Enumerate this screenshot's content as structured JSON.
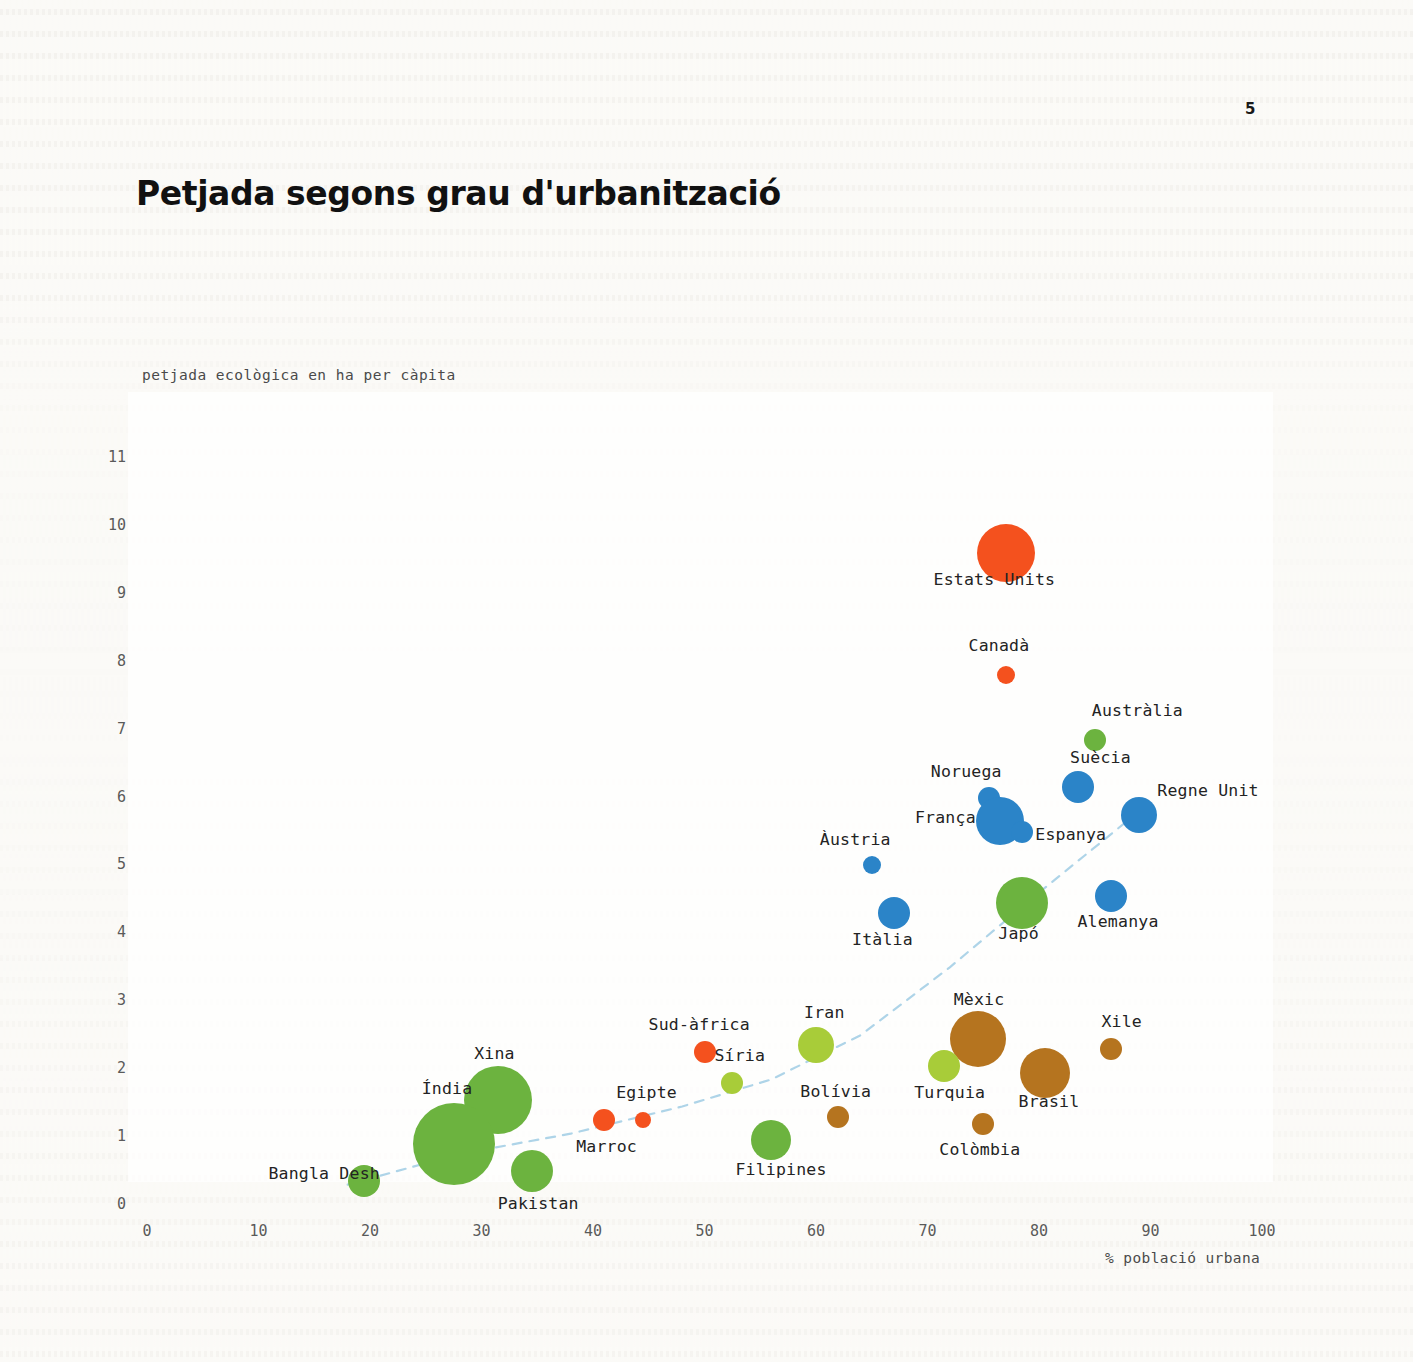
{
  "page": {
    "number": "5"
  },
  "header": {
    "title": "Petjada segons grau d'urbanització"
  },
  "axes": {
    "y_title": "petjada ecològica en ha per càpita",
    "x_title": "% població urbana",
    "y_ticks": [
      "0",
      "1",
      "2",
      "3",
      "4",
      "5",
      "6",
      "7",
      "8",
      "9",
      "10",
      "11"
    ],
    "x_ticks": [
      "0",
      "10",
      "20",
      "30",
      "40",
      "50",
      "60",
      "70",
      "80",
      "90",
      "100"
    ]
  },
  "colors": {
    "orange": "#f4511e",
    "blue": "#2b84c8",
    "green": "#6cb33f",
    "lime": "#a8cc39",
    "brown": "#b5741f",
    "trendline": "#aed4e8",
    "text": "#232323",
    "tick": "#5a5a5a",
    "background": "#fbfaf7"
  },
  "chart_data": {
    "type": "scatter",
    "title": "Petjada segons grau d'urbanització",
    "xlabel": "% població urbana",
    "ylabel": "petjada ecològica en ha per càpita",
    "xlim": [
      0,
      100
    ],
    "ylim": [
      0,
      11
    ],
    "grid": false,
    "legend": "none",
    "size_encodes": "població total",
    "color_encodes": "regió",
    "trendline": {
      "style": "dashed",
      "color": "#aed4e8",
      "description": "corba de tendència creixent de baix-esquerra a dalt-dreta"
    },
    "points": [
      {
        "label": "Estats Units",
        "x": 77,
        "y": 9.6,
        "size": 29,
        "color": "orange",
        "label_dx": -72,
        "label_dy": 26
      },
      {
        "label": "Canadà",
        "x": 77,
        "y": 7.8,
        "size": 9,
        "color": "orange",
        "label_dx": -37,
        "label_dy": -30
      },
      {
        "label": "Austràlia",
        "x": 85,
        "y": 6.85,
        "size": 11,
        "color": "green",
        "label_dx": -3,
        "label_dy": -30
      },
      {
        "label": "Suècia",
        "x": 83.5,
        "y": 6.15,
        "size": 16,
        "color": "blue",
        "label_dx": -8,
        "label_dy": -30
      },
      {
        "label": "Regne Unit",
        "x": 89,
        "y": 5.75,
        "size": 18,
        "color": "blue",
        "label_dx": 18,
        "label_dy": -25
      },
      {
        "label": "Noruega",
        "x": 75.5,
        "y": 6.0,
        "size": 11,
        "color": "blue",
        "label_dx": -58,
        "label_dy": -27
      },
      {
        "label": "França",
        "x": 76.5,
        "y": 5.65,
        "size": 24,
        "color": "blue",
        "label_dx": -85,
        "label_dy": -4
      },
      {
        "label": "Espanya",
        "x": 78.5,
        "y": 5.5,
        "size": 11,
        "color": "blue",
        "label_dx": 13,
        "label_dy": 2
      },
      {
        "label": "Àustria",
        "x": 65,
        "y": 5.0,
        "size": 9,
        "color": "blue",
        "label_dx": -52,
        "label_dy": -26
      },
      {
        "label": "Alemanya",
        "x": 86.5,
        "y": 4.55,
        "size": 16,
        "color": "blue",
        "label_dx": -34,
        "label_dy": 25
      },
      {
        "label": "Itàlia",
        "x": 67,
        "y": 4.3,
        "size": 16,
        "color": "blue",
        "label_dx": -42,
        "label_dy": 26
      },
      {
        "label": "Japó",
        "x": 78.5,
        "y": 4.45,
        "size": 26,
        "color": "green",
        "label_dx": -24,
        "label_dy": 30
      },
      {
        "label": "Mèxic",
        "x": 74.5,
        "y": 2.45,
        "size": 28,
        "color": "brown",
        "label_dx": -24,
        "label_dy": -40
      },
      {
        "label": "Xile",
        "x": 86.5,
        "y": 2.3,
        "size": 11,
        "color": "brown",
        "label_dx": -10,
        "label_dy": -28
      },
      {
        "label": "Brasil",
        "x": 80.5,
        "y": 1.95,
        "size": 25,
        "color": "brown",
        "label_dx": -26,
        "label_dy": 28
      },
      {
        "label": "Turquia",
        "x": 71.5,
        "y": 2.05,
        "size": 16,
        "color": "lime",
        "label_dx": -30,
        "label_dy": 26
      },
      {
        "label": "Colòmbia",
        "x": 75,
        "y": 1.2,
        "size": 11,
        "color": "brown",
        "label_dx": -44,
        "label_dy": 25
      },
      {
        "label": "Iran",
        "x": 60,
        "y": 2.35,
        "size": 18,
        "color": "lime",
        "label_dx": -12,
        "label_dy": -33
      },
      {
        "label": "Sud-àfrica",
        "x": 50,
        "y": 2.25,
        "size": 11,
        "color": "orange",
        "label_dx": -56,
        "label_dy": -28
      },
      {
        "label": "Síria",
        "x": 52.5,
        "y": 1.8,
        "size": 11,
        "color": "lime",
        "label_dx": -18,
        "label_dy": -28
      },
      {
        "label": "Bolívia",
        "x": 62,
        "y": 1.3,
        "size": 11,
        "color": "brown",
        "label_dx": -38,
        "label_dy": -26
      },
      {
        "label": "Filipines",
        "x": 56,
        "y": 0.95,
        "size": 20,
        "color": "green",
        "label_dx": -36,
        "label_dy": 29
      },
      {
        "label": "Egipte",
        "x": 44.5,
        "y": 1.25,
        "size": 8,
        "color": "orange",
        "label_dx": -27,
        "label_dy": -28
      },
      {
        "label": "Marroc",
        "x": 41,
        "y": 1.25,
        "size": 11,
        "color": "orange",
        "label_dx": -28,
        "label_dy": 26
      },
      {
        "label": "Xina",
        "x": 31.5,
        "y": 1.55,
        "size": 34,
        "color": "green",
        "label_dx": -24,
        "label_dy": -47
      },
      {
        "label": "Índia",
        "x": 27.5,
        "y": 0.9,
        "size": 41,
        "color": "green",
        "label_dx": -32,
        "label_dy": -56
      },
      {
        "label": "Pakistan",
        "x": 34.5,
        "y": 0.5,
        "size": 21,
        "color": "green",
        "label_dx": -34,
        "label_dy": 32
      },
      {
        "label": "Bangla Desh",
        "x": 19.5,
        "y": 0.35,
        "size": 16,
        "color": "green",
        "label_dx": -96,
        "label_dy": -8
      }
    ]
  }
}
